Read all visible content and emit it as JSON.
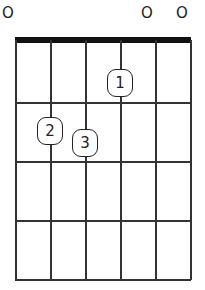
{
  "chord": {
    "open_strings": [
      {
        "string": 1,
        "label": "O",
        "x": 8
      },
      {
        "string": 5,
        "label": "O",
        "x": 147
      },
      {
        "string": 6,
        "label": "O",
        "x": 182
      }
    ],
    "strings_x": [
      15,
      50,
      85,
      120,
      155,
      190
    ],
    "frets_y": [
      102,
      161,
      220,
      279
    ],
    "fingers": [
      {
        "label": "1",
        "string": 4,
        "fret": 1,
        "x": 107,
        "y": 69
      },
      {
        "label": "2",
        "string": 2,
        "fret": 2,
        "x": 37,
        "y": 117
      },
      {
        "label": "3",
        "string": 3,
        "fret": 2,
        "x": 72,
        "y": 129
      }
    ],
    "colors": {
      "line": "#333333",
      "nut": "#111111",
      "background": "#ffffff"
    }
  }
}
